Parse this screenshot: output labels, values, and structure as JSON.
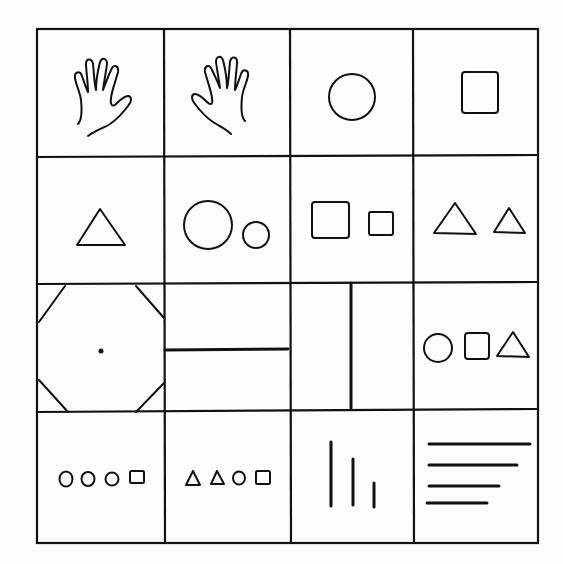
{
  "grid": {
    "rows": 4,
    "cols": 4
  },
  "cells": [
    {
      "row": 1,
      "col": 1,
      "content": "left hand outline (palm view)"
    },
    {
      "row": 1,
      "col": 2,
      "content": "right hand outline (palm view)"
    },
    {
      "row": 1,
      "col": 3,
      "content": "circle"
    },
    {
      "row": 1,
      "col": 4,
      "content": "square"
    },
    {
      "row": 2,
      "col": 1,
      "content": "triangle"
    },
    {
      "row": 2,
      "col": 2,
      "content": "large circle, small circle"
    },
    {
      "row": 2,
      "col": 3,
      "content": "large square, small square"
    },
    {
      "row": 2,
      "col": 4,
      "content": "large triangle, small triangle"
    },
    {
      "row": 3,
      "col": 1,
      "content": "octagon with center dot"
    },
    {
      "row": 3,
      "col": 2,
      "content": "horizontal divider line"
    },
    {
      "row": 3,
      "col": 3,
      "content": "vertical divider line"
    },
    {
      "row": 3,
      "col": 4,
      "content": "circle, square, triangle"
    },
    {
      "row": 4,
      "col": 1,
      "content": "circle, circle, circle, square"
    },
    {
      "row": 4,
      "col": 2,
      "content": "triangle, triangle, circle, square"
    },
    {
      "row": 4,
      "col": 3,
      "content": "three vertical lines of decreasing length"
    },
    {
      "row": 4,
      "col": 4,
      "content": "four horizontal lines of decreasing length"
    }
  ]
}
